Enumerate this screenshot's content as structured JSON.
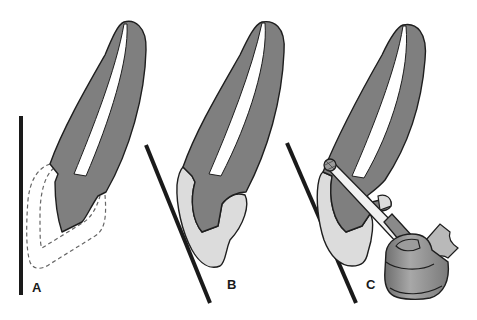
{
  "figure": {
    "type": "dental-illustration",
    "panels": [
      {
        "id": "A",
        "label": "A",
        "description": "Tooth with dashed outline of lost crown structure; vertical reference line"
      },
      {
        "id": "B",
        "label": "B",
        "description": "Tooth with light-gray restoration/build-up; angled reference line"
      },
      {
        "id": "C",
        "label": "C",
        "description": "Tooth with restoration being prepared by bur on handpiece; angled reference line"
      }
    ]
  },
  "colors": {
    "tooth_fill": "#7f7f7f",
    "restoration_fill": "#dcdcdc",
    "canal_fill": "#ffffff",
    "outline": "#1e1e1e",
    "line": "#1a1a1a",
    "handpiece_fill": "#8a8a8a",
    "background": "#ffffff"
  }
}
